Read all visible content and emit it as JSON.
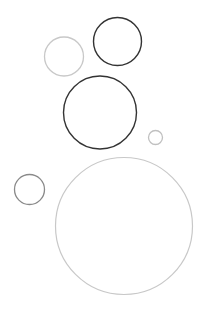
{
  "canvas": {
    "width": 204,
    "height": 314,
    "background": "#ffffff"
  },
  "colors": {
    "dark": "#333333",
    "mid": "#8a8a8a",
    "light": "#c8c8c8"
  },
  "circles": [
    {
      "id": "circle-top-dark",
      "cx": 117.5,
      "cy": 41.5,
      "r": 24,
      "stroke": "#333333",
      "stroke_width": 1.4
    },
    {
      "id": "circle-top-left-light",
      "cx": 64,
      "cy": 56.5,
      "r": 19.5,
      "stroke": "#c8c8c8",
      "stroke_width": 1.3
    },
    {
      "id": "circle-middle-dark",
      "cx": 100,
      "cy": 112.5,
      "r": 36.5,
      "stroke": "#333333",
      "stroke_width": 1.4
    },
    {
      "id": "circle-small-right",
      "cx": 155.5,
      "cy": 137.5,
      "r": 7,
      "stroke": "#c0c0c0",
      "stroke_width": 1.3
    },
    {
      "id": "circle-small-left",
      "cx": 29.5,
      "cy": 189.5,
      "r": 15,
      "stroke": "#8a8a8a",
      "stroke_width": 1.3
    },
    {
      "id": "circle-large-light",
      "cx": 124,
      "cy": 226,
      "r": 68.5,
      "stroke": "#c8c8c8",
      "stroke_width": 1.2
    }
  ]
}
